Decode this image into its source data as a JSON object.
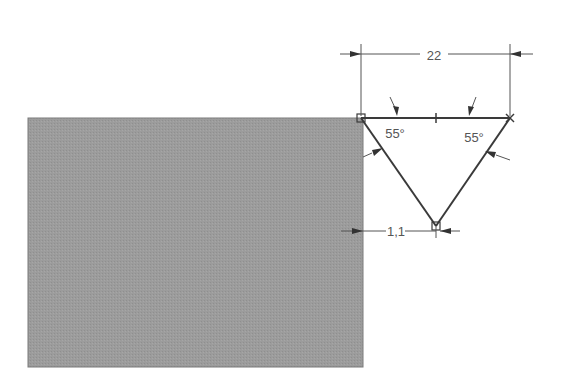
{
  "drawing": {
    "type": "cad-sketch",
    "colors": {
      "background": "#ffffff",
      "solid_fill": "#9a9a9a",
      "line": "#3a3a3a",
      "dimension": "#555555"
    },
    "solid_block": {
      "x": 28,
      "y": 118,
      "width": 335,
      "height": 249
    },
    "triangle": {
      "vertices": [
        [
          361,
          118
        ],
        [
          510,
          118
        ],
        [
          436,
          226
        ]
      ],
      "top_midpoint_tick_x": 436
    },
    "dimensions": {
      "top_width": {
        "label": "22",
        "y": 54,
        "x1": 361,
        "x2": 510
      },
      "offset": {
        "label": "1,1",
        "y": 231,
        "x1": 341,
        "x2": 436
      },
      "angle_left": {
        "label": "55°"
      },
      "angle_right": {
        "label": "55°"
      }
    },
    "markers": {
      "left_vertex": "square-constraint",
      "right_vertex": "cross-constraint",
      "bottom_vertex": "square-constraint"
    }
  }
}
